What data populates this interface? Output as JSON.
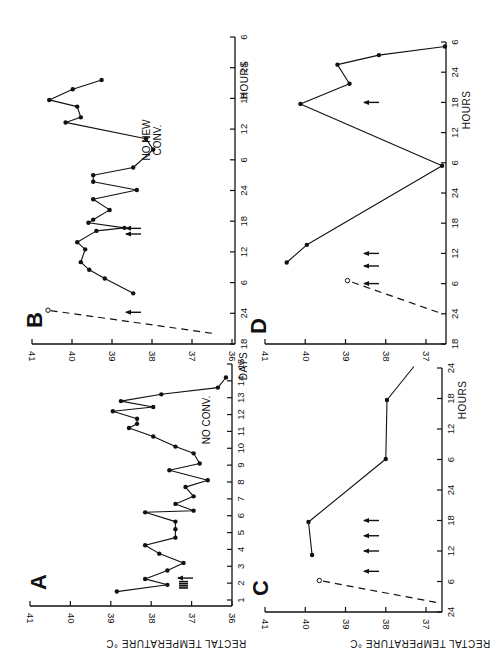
{
  "figure": {
    "orientation": "rotated-90-ccw",
    "y_axis_title": "RECTAL TEMPERATURE °C",
    "panels": [
      {
        "id": "A",
        "letter": "A",
        "x_title": "DAYS",
        "annotation": "NO CONV."
      },
      {
        "id": "B",
        "letter": "B",
        "x_title": "HOURS",
        "annotation_lines": [
          "NO NEW",
          "CONV."
        ]
      },
      {
        "id": "C",
        "letter": "C",
        "x_title": "HOURS"
      },
      {
        "id": "D",
        "letter": "D",
        "x_title": "HOURS"
      }
    ]
  },
  "chart_data": [
    {
      "panel": "A",
      "type": "line",
      "title": "A",
      "xlabel": "DAYS",
      "ylabel": "RECTAL TEMPERATURE °C",
      "x_ticks": [
        "1",
        "2",
        "3",
        "4",
        "5",
        "6",
        "7",
        "8",
        "9",
        "10",
        "11",
        "12",
        "13",
        "14",
        "15"
      ],
      "y_ticks": [
        "36",
        "37",
        "38",
        "39",
        "40",
        "41"
      ],
      "xlim": [
        1,
        15
      ],
      "ylim": [
        36,
        41
      ],
      "annotations": [
        {
          "text": "NO CONV.",
          "x": 11.5,
          "y": 36.7
        }
      ],
      "convulsion_arrows": [
        {
          "x": 1.9,
          "count": 4,
          "clustered": true
        },
        {
          "x": 2.3,
          "count": 1
        }
      ],
      "series": [
        {
          "name": "temperature",
          "x": [
            1.5,
            1.9,
            2.25,
            2.75,
            3.2,
            3.75,
            4.25,
            4.7,
            5.2,
            5.65,
            6.2,
            6.3,
            6.7,
            7.15,
            7.7,
            8.1,
            8.7,
            9.1,
            9.7,
            10.1,
            10.7,
            11.2,
            11.45,
            11.75,
            12.2,
            12.45,
            12.8,
            13.2,
            13.6,
            14.2
          ],
          "values": [
            38.85,
            37.6,
            38.15,
            37.6,
            37.2,
            37.8,
            38.15,
            37.4,
            37.4,
            37.4,
            38.15,
            36.95,
            37.4,
            36.95,
            37.15,
            36.6,
            37.55,
            36.8,
            36.95,
            37.4,
            37.95,
            38.55,
            38.35,
            38.35,
            38.95,
            37.95,
            38.75,
            37.75,
            36.35,
            36.15
          ]
        }
      ]
    },
    {
      "panel": "B",
      "type": "line",
      "title": "B",
      "xlabel": "HOURS",
      "ylabel": "RECTAL TEMPERATURE °C",
      "x_ticks": [
        "18",
        "24",
        "6",
        "12",
        "18",
        "24",
        "6",
        "12",
        "18",
        "24",
        "6"
      ],
      "y_ticks": [
        "36",
        "37",
        "38",
        "39",
        "40",
        "41"
      ],
      "xlim": [
        0,
        60
      ],
      "ylim": [
        36,
        41
      ],
      "annotations": [
        {
          "text": "NO NEW CONV.",
          "x": 38,
          "y": 37.2
        }
      ],
      "convulsion_arrows": [
        {
          "x": 6.2
        },
        {
          "x": 21.5
        },
        {
          "x": 22.6
        }
      ],
      "onset_line": {
        "style": "dashed",
        "from": [
          2.1,
          36.5
        ],
        "to": [
          6.6,
          40.6
        ],
        "open_marker_at": [
          6.6,
          40.6
        ]
      },
      "series": [
        {
          "name": "temperature",
          "x": [
            9.9,
            12.8,
            14.5,
            16.0,
            18.5,
            19.9,
            22.1,
            22.7,
            23.7,
            24.3,
            26.2,
            28.3,
            30.1,
            31.7,
            33.0,
            34.5,
            38.0,
            40.1,
            43.3,
            44.3,
            46.4,
            47.7,
            49.8,
            51.6
          ],
          "values": [
            38.47,
            39.18,
            39.57,
            39.78,
            39.67,
            39.87,
            39.39,
            38.69,
            39.59,
            39.47,
            39.06,
            39.47,
            38.38,
            39.47,
            39.47,
            38.47,
            37.97,
            38.15,
            40.16,
            39.78,
            39.87,
            40.57,
            39.98,
            39.26
          ]
        }
      ]
    },
    {
      "panel": "C",
      "type": "line",
      "title": "C",
      "xlabel": "HOURS",
      "ylabel": "RECTAL TEMPERATURE °C",
      "x_ticks": [
        "24",
        "6",
        "12",
        "18",
        "24",
        "6",
        "12",
        "18",
        "24"
      ],
      "y_ticks": [
        "37",
        "38",
        "39",
        "40",
        "41"
      ],
      "xlim": [
        0,
        48
      ],
      "ylim": [
        36.7,
        41
      ],
      "convulsion_arrows": [
        {
          "x": 8.0
        },
        {
          "x": 12.0
        },
        {
          "x": 15.0
        },
        {
          "x": 18.0
        }
      ],
      "onset_line": {
        "style": "dashed",
        "from": [
          1.9,
          36.75
        ],
        "to": [
          6.2,
          39.65
        ],
        "open_marker_at": [
          6.2,
          39.65
        ]
      },
      "series": [
        {
          "name": "temperature",
          "x": [
            11.2,
            17.7,
            30.1,
            41.7
          ],
          "values": [
            39.83,
            39.92,
            38.0,
            37.97
          ]
        }
      ],
      "trailing_line": {
        "from": [
          41.7,
          37.97
        ],
        "to": [
          48.3,
          37.3
        ]
      }
    },
    {
      "panel": "D",
      "type": "line",
      "title": "D",
      "xlabel": "HOURS",
      "ylabel": "RECTAL TEMPERATURE °C",
      "x_ticks": [
        "18",
        "24",
        "6",
        "12",
        "18",
        "24",
        "6",
        "12",
        "18",
        "24",
        "6"
      ],
      "y_ticks": [
        "37",
        "38",
        "39",
        "40",
        "41"
      ],
      "xlim": [
        0,
        60
      ],
      "ylim": [
        36.5,
        41
      ],
      "convulsion_arrows": [
        {
          "x": 12.0
        },
        {
          "x": 15.5
        },
        {
          "x": 18.0
        },
        {
          "x": 48.0
        }
      ],
      "onset_line": {
        "style": "dashed",
        "from": [
          6.3,
          36.7
        ],
        "to": [
          12.6,
          38.95
        ],
        "open_marker_at": [
          12.6,
          38.95
        ]
      },
      "series": [
        {
          "name": "temperature",
          "x": [
            16.2,
            19.7,
            35.4,
            47.7,
            51.7,
            55.5,
            57.4,
            59.1
          ],
          "values": [
            40.46,
            39.96,
            36.6,
            40.12,
            38.9,
            39.2,
            38.17,
            36.53
          ]
        }
      ]
    }
  ],
  "layout": {
    "panels": {
      "A": {
        "t_axis_px": 232,
        "temp_hi": 41,
        "temp_lo": 36,
        "temp_hi_px": 30,
        "temp_lo_px": 232,
        "time_lo": 1,
        "time_hi": 15,
        "time_lo_px": 600,
        "time_hi_px": 364,
        "temp_axis_y": 606,
        "tick_mode": "index",
        "ticks": 15,
        "axis_start_px": 606,
        "letter_px": [
          46,
          582
        ],
        "x_title_px": [
          247,
          366
        ],
        "note_px": [
          210,
          420
        ]
      },
      "B": {
        "t_axis_px": 235,
        "temp_hi": 41,
        "temp_lo": 36,
        "temp_hi_px": 32,
        "temp_lo_px": 232,
        "time_lo": 0,
        "time_hi": 60,
        "time_lo_px": 344,
        "time_hi_px": 37,
        "temp_axis_y": 344,
        "tick_mode": "index",
        "ticks": 11,
        "axis_start_px": 344,
        "letter_px": [
          42,
          320
        ],
        "x_title_px": [
          248,
          80
        ],
        "note_px": [
          150,
          140
        ]
      },
      "C": {
        "t_axis_px": 442,
        "temp_hi": 41,
        "temp_lo": 37,
        "temp_hi_px": 265,
        "temp_lo_px": 426,
        "time_lo": 0,
        "time_hi": 48,
        "time_lo_px": 612,
        "time_hi_px": 368,
        "temp_axis_y": 612,
        "tick_mode": "index",
        "ticks": 9,
        "axis_start_px": 612,
        "letter_px": [
          268,
          588
        ],
        "x_title_px": [
          466,
          400
        ]
      },
      "D": {
        "t_axis_px": 446,
        "temp_hi": 41,
        "temp_lo": 37,
        "temp_hi_px": 265,
        "temp_lo_px": 426,
        "time_lo": 0,
        "time_hi": 60,
        "time_lo_px": 344,
        "time_hi_px": 42,
        "temp_axis_y": 344,
        "tick_mode": "index",
        "ticks": 11,
        "axis_start_px": 344,
        "letter_px": [
          266,
          326
        ],
        "x_title_px": [
          470,
          110
        ]
      }
    },
    "y_title_px": [
      176,
      640
    ],
    "y_title_px_2": [
      420,
      640
    ]
  }
}
